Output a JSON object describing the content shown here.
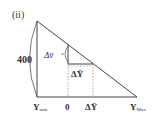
{
  "figure": {
    "label": "(ii)",
    "height_label": "400",
    "delta_v_label": "Δv̄",
    "delta_y_inner_label": "ΔȲ",
    "axis_labels": {
      "y_min": "Y",
      "y_min_sub": "min",
      "zero": "0",
      "delta_y": "ΔȲ",
      "y_max": "Y",
      "y_max_sub": "Max"
    },
    "colors": {
      "line": "#444444",
      "dashed": "#888888",
      "text": "#333333"
    }
  }
}
